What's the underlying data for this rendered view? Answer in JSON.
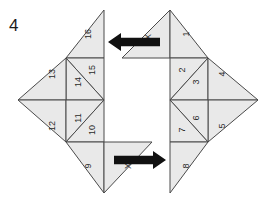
{
  "figure": {
    "caption": "4",
    "type": "tangram-dissection-diagram",
    "background_color": "#ffffff",
    "piece_fill_color": "#e9e9e9",
    "piece_stroke_color": "#4a4a4a",
    "arrow_color": "#111111",
    "label_color": "#2a2a2a"
  },
  "left_group": {
    "name": "left-half-figure",
    "pieces": [
      {
        "id": "p16",
        "label": "16",
        "cx": 88,
        "cy": 34,
        "rotation": -90,
        "points": "104,10 104,58 66,58"
      },
      {
        "id": "p15",
        "label": "15",
        "cx": 92,
        "cy": 70,
        "rotation": -90,
        "points": "104,58 104,100 66,58"
      },
      {
        "id": "p14",
        "label": "14",
        "cx": 78,
        "cy": 82,
        "rotation": -90,
        "points": "66,58 104,100 66,100"
      },
      {
        "id": "p13",
        "label": "13",
        "cx": 52,
        "cy": 74,
        "rotation": -90,
        "points": "66,58 66,100 18,100"
      },
      {
        "id": "p12",
        "label": "12",
        "cx": 52,
        "cy": 126,
        "rotation": -90,
        "points": "18,100 66,100 66,142"
      },
      {
        "id": "p11",
        "label": "11",
        "cx": 78,
        "cy": 118,
        "rotation": -90,
        "points": "66,100 104,100 66,142"
      },
      {
        "id": "p10",
        "label": "10",
        "cx": 92,
        "cy": 130,
        "rotation": -90,
        "points": "104,100 104,142 66,142"
      },
      {
        "id": "p9",
        "label": "9",
        "cx": 88,
        "cy": 166,
        "rotation": -90,
        "points": "66,142 104,142 104,193"
      },
      {
        "id": "pXb",
        "label": "X",
        "cx": 128,
        "cy": 166,
        "rotation": -90,
        "points": "104,142 152,142 104,193"
      }
    ]
  },
  "right_group": {
    "name": "right-half-figure",
    "pieces": [
      {
        "id": "pXt",
        "label": "X",
        "cx": 148,
        "cy": 37,
        "rotation": -90,
        "points": "170,10 170,58 122,58"
      },
      {
        "id": "p1",
        "label": "1",
        "cx": 186,
        "cy": 34,
        "rotation": -90,
        "points": "170,10 208,58 170,58"
      },
      {
        "id": "p2",
        "label": "2",
        "cx": 182,
        "cy": 70,
        "rotation": -90,
        "points": "170,58 208,58 170,100"
      },
      {
        "id": "p3",
        "label": "3",
        "cx": 196,
        "cy": 82,
        "rotation": -90,
        "points": "208,58 208,100 170,100"
      },
      {
        "id": "p4",
        "label": "4",
        "cx": 222,
        "cy": 74,
        "rotation": -90,
        "points": "208,58 258,100 208,100"
      },
      {
        "id": "p5",
        "label": "5",
        "cx": 222,
        "cy": 126,
        "rotation": -90,
        "points": "208,100 258,100 208,142"
      },
      {
        "id": "p6",
        "label": "6",
        "cx": 196,
        "cy": 118,
        "rotation": -90,
        "points": "170,100 208,100 208,142"
      },
      {
        "id": "p7",
        "label": "7",
        "cx": 182,
        "cy": 130,
        "rotation": -90,
        "points": "170,100 208,142 170,142"
      },
      {
        "id": "p8",
        "label": "8",
        "cx": 186,
        "cy": 166,
        "rotation": -90,
        "points": "170,142 208,142 170,193"
      }
    ]
  },
  "arrows": [
    {
      "id": "arrow-top",
      "name": "arrow-left",
      "direction": "left",
      "tail_x": 160,
      "head_x": 108,
      "y": 42,
      "label": ""
    },
    {
      "id": "arrow-bottom",
      "name": "arrow-right",
      "direction": "right",
      "tail_x": 114,
      "head_x": 166,
      "y": 160,
      "label": ""
    }
  ]
}
